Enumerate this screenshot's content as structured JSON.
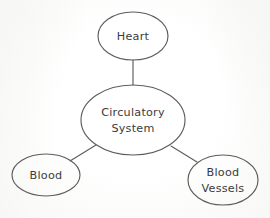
{
  "diagram": {
    "type": "concept-map",
    "title": "Circulatory System",
    "background_color": "#fdfdfc",
    "stroke_color": "#5d5d5d",
    "text_color": "#3b3b3b",
    "nodes": [
      {
        "id": "heart",
        "label": "Heart",
        "lines": [
          "Heart"
        ],
        "role": "leaf",
        "cx": 133,
        "cy": 36,
        "rx": 35,
        "ry": 24
      },
      {
        "id": "circulatory-system",
        "label": "Circulatory System",
        "lines": [
          "Circulatory",
          "System"
        ],
        "role": "root",
        "cx": 133,
        "cy": 120,
        "rx": 52,
        "ry": 35
      },
      {
        "id": "blood",
        "label": "Blood",
        "lines": [
          "Blood"
        ],
        "role": "leaf",
        "cx": 46,
        "cy": 175,
        "rx": 34,
        "ry": 21
      },
      {
        "id": "blood-vessels",
        "label": "Blood Vessels",
        "lines": [
          "Blood",
          "Vessels"
        ],
        "role": "leaf",
        "cx": 223,
        "cy": 180,
        "rx": 35,
        "ry": 25
      }
    ],
    "edges": [
      {
        "id": "edge-center-heart",
        "from": "circulatory-system",
        "to": "heart",
        "x1": 133,
        "y1": 85,
        "x2": 133,
        "y2": 60
      },
      {
        "id": "edge-center-blood",
        "from": "circulatory-system",
        "to": "blood",
        "x1": 96,
        "y1": 145,
        "x2": 70,
        "y2": 161
      },
      {
        "id": "edge-center-blood-vessels",
        "from": "circulatory-system",
        "to": "blood-vessels",
        "x1": 171,
        "y1": 146,
        "x2": 197,
        "y2": 162
      }
    ]
  }
}
